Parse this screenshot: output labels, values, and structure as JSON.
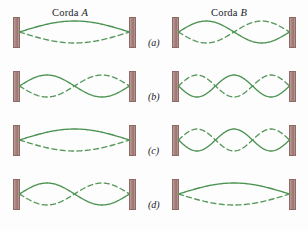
{
  "figure": {
    "background_color": "#fdfdfd",
    "wave_color": "#4a9250",
    "wave_dashed_color": "#57985c",
    "wall_color": "#a07a75"
  },
  "columns": [
    {
      "id": "corda-a",
      "title_prefix": "Corda ",
      "title_letter": "A",
      "wall_left_x": 13,
      "wall_right_x": 129,
      "title_x": 52
    },
    {
      "id": "corda-b",
      "title_prefix": "Corda ",
      "title_letter": "B",
      "wall_left_x": 172,
      "wall_right_x": 289,
      "title_x": 211
    }
  ],
  "rows": [
    {
      "label": "(a)",
      "y": 12,
      "panels": [
        {
          "column": "corda-a",
          "loops": 1,
          "first_phase": "solid"
        },
        {
          "column": "corda-b",
          "loops": 2,
          "first_phase": "solid"
        }
      ]
    },
    {
      "label": "(b)",
      "y": 66,
      "panels": [
        {
          "column": "corda-a",
          "loops": 2,
          "first_phase": "solid"
        },
        {
          "column": "corda-b",
          "loops": 3,
          "first_phase": "dashed"
        }
      ]
    },
    {
      "label": "(c)",
      "y": 120,
      "panels": [
        {
          "column": "corda-a",
          "loops": 1,
          "first_phase": "solid"
        },
        {
          "column": "corda-b",
          "loops": 3,
          "first_phase": "dashed"
        }
      ]
    },
    {
      "label": "(d)",
      "y": 174,
      "panels": [
        {
          "column": "corda-a",
          "loops": 2,
          "first_phase": "solid"
        },
        {
          "column": "corda-b",
          "loops": 1,
          "first_phase": "solid"
        }
      ]
    }
  ],
  "geometry": {
    "wall_width": 7,
    "wall_height": 31,
    "wall_offset_y": 5,
    "string_center_offset_y": 20,
    "amplitude": 11,
    "row_label_x": 148,
    "row_label_offset_y": 25,
    "title_offset_y": 0
  }
}
